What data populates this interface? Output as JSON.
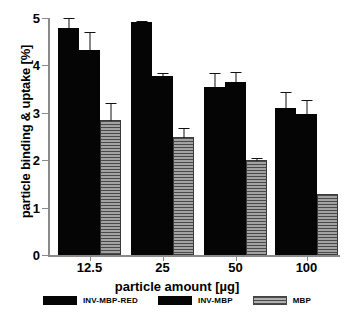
{
  "chart_data": {
    "type": "bar",
    "title": "",
    "xlabel": "particle amount [µg]",
    "ylabel": "particle binding & uptake [%]",
    "categories": [
      "12.5",
      "25",
      "50",
      "100"
    ],
    "ylim": [
      0,
      5
    ],
    "yticks": [
      "0",
      "1",
      "2",
      "3",
      "4",
      "5"
    ],
    "grid": false,
    "legend_position": "bottom",
    "series": [
      {
        "name": "INV-MBP-RED",
        "color": "#050505",
        "fill": "solid",
        "values": [
          4.78,
          4.92,
          3.55,
          3.1
        ],
        "errors": [
          0.22,
          0.02,
          0.3,
          0.33
        ]
      },
      {
        "name": "INV-MBP",
        "color": "#050505",
        "fill": "solid",
        "values": [
          4.33,
          3.78,
          3.65,
          2.97
        ],
        "errors": [
          0.37,
          0.06,
          0.22,
          0.31
        ]
      },
      {
        "name": "MBP",
        "color": "#8d8d8d",
        "fill": "horizontal-hatch",
        "values": [
          2.85,
          2.5,
          2.0,
          1.28
        ],
        "errors": [
          0.38,
          0.2,
          0.07,
          0.0
        ]
      }
    ]
  },
  "caption": ""
}
